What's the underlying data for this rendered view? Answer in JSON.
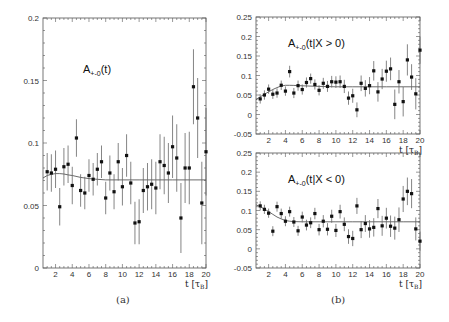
{
  "figure": {
    "captions": [
      "(a)",
      "(b)"
    ]
  },
  "chart_data": [
    {
      "type": "scatter",
      "panel": "a",
      "title": "A+-0(t)",
      "title_main": "A",
      "title_sub": "+-0",
      "title_rest": "(t)",
      "xlabel": "t [τB]",
      "ylabel": "",
      "xlim": [
        0.5,
        20
      ],
      "ylim": [
        0,
        0.2
      ],
      "xticks": [
        2,
        4,
        6,
        8,
        10,
        12,
        14,
        16,
        18,
        20
      ],
      "yticks": [
        0,
        0.05,
        0.1,
        0.15,
        0.2
      ],
      "ytick_labels": [
        "0",
        "0.05",
        "0.1",
        "0.15",
        "0.2"
      ],
      "grid": false,
      "fit_line": {
        "x": [
          0.5,
          1,
          1.5,
          2,
          2.5,
          3,
          3.5,
          4,
          5,
          6,
          7,
          8,
          10,
          12,
          14,
          16,
          18,
          20
        ],
        "y": [
          0.072,
          0.074,
          0.075,
          0.0755,
          0.0755,
          0.0752,
          0.0745,
          0.074,
          0.0725,
          0.0715,
          0.071,
          0.0705,
          0.0705,
          0.0705,
          0.0705,
          0.0705,
          0.0705,
          0.0705
        ]
      },
      "points": {
        "x": [
          1.0,
          1.5,
          2.0,
          2.5,
          3.0,
          3.5,
          4.0,
          4.5,
          5.0,
          5.5,
          6.0,
          6.5,
          7.0,
          7.5,
          8.0,
          8.5,
          9.0,
          9.5,
          10.0,
          10.5,
          11.0,
          11.5,
          12.0,
          12.5,
          13.0,
          13.5,
          14.0,
          14.5,
          15.0,
          15.5,
          16.0,
          16.5,
          17.0,
          17.5,
          18.0,
          18.5,
          19.0,
          19.5,
          20.0
        ],
        "y": [
          0.077,
          0.076,
          0.079,
          0.049,
          0.081,
          0.083,
          0.066,
          0.104,
          0.062,
          0.06,
          0.074,
          0.071,
          0.079,
          0.085,
          0.056,
          0.076,
          0.061,
          0.085,
          0.065,
          0.09,
          0.068,
          0.036,
          0.037,
          0.062,
          0.065,
          0.067,
          0.064,
          0.085,
          0.082,
          0.076,
          0.097,
          0.088,
          0.04,
          0.08,
          0.08,
          0.145,
          0.12,
          0.052,
          0.093
        ],
        "err": [
          0.015,
          0.015,
          0.015,
          0.015,
          0.015,
          0.015,
          0.015,
          0.015,
          0.013,
          0.013,
          0.013,
          0.013,
          0.013,
          0.013,
          0.013,
          0.014,
          0.014,
          0.015,
          0.015,
          0.017,
          0.017,
          0.017,
          0.018,
          0.018,
          0.019,
          0.02,
          0.021,
          0.022,
          0.023,
          0.024,
          0.025,
          0.027,
          0.028,
          0.028,
          0.029,
          0.03,
          0.032,
          0.033,
          0.035
        ]
      },
      "frame": {
        "x0": 43,
        "y0": 18,
        "x1": 206,
        "y1": 268
      }
    },
    {
      "type": "scatter",
      "panel": "b-top",
      "title": "A+-0(t|X > 0)",
      "title_main": "A",
      "title_sub": "+-0",
      "title_rest": "(t|X > 0)",
      "xlabel": "t [τB]",
      "ylabel": "",
      "xlim": [
        0.5,
        20
      ],
      "ylim": [
        -0.05,
        0.25
      ],
      "xticks": [
        2,
        4,
        6,
        8,
        10,
        12,
        14,
        16,
        18,
        20
      ],
      "yticks": [
        -0.05,
        0,
        0.05,
        0.1,
        0.15,
        0.2,
        0.25
      ],
      "ytick_labels": [
        "-0.05",
        "0",
        "0.05",
        "0.1",
        "0.15",
        "0.2",
        "0.25"
      ],
      "grid": false,
      "fit_line": {
        "x": [
          0.5,
          1,
          1.5,
          2,
          2.5,
          3,
          3.5,
          4,
          4.5,
          5,
          6,
          8,
          10,
          12,
          14,
          16,
          18,
          20
        ],
        "y": [
          0.038,
          0.045,
          0.052,
          0.058,
          0.064,
          0.069,
          0.073,
          0.075,
          0.075,
          0.0745,
          0.0735,
          0.072,
          0.071,
          0.071,
          0.071,
          0.071,
          0.071,
          0.071
        ]
      },
      "points": {
        "x": [
          1.0,
          1.5,
          2.0,
          2.5,
          3.0,
          3.5,
          4.0,
          4.5,
          5.0,
          5.5,
          6.0,
          6.5,
          7.0,
          7.5,
          8.0,
          8.5,
          9.0,
          9.5,
          10.0,
          10.5,
          11.0,
          11.5,
          12.0,
          12.5,
          13.0,
          13.5,
          14.0,
          14.5,
          15.0,
          15.5,
          16.0,
          16.5,
          17.0,
          17.5,
          18.0,
          18.5,
          19.0,
          19.5,
          20.0
        ],
        "y": [
          0.04,
          0.05,
          0.065,
          0.052,
          0.055,
          0.075,
          0.06,
          0.11,
          0.055,
          0.074,
          0.064,
          0.082,
          0.092,
          0.077,
          0.062,
          0.08,
          0.072,
          0.084,
          0.083,
          0.084,
          0.072,
          0.042,
          0.048,
          0.012,
          0.08,
          0.067,
          0.074,
          0.112,
          0.058,
          0.091,
          0.111,
          0.117,
          0.026,
          0.084,
          0.033,
          0.14,
          0.096,
          0.053,
          0.165
        ],
        "err": [
          0.012,
          0.012,
          0.012,
          0.012,
          0.012,
          0.012,
          0.012,
          0.015,
          0.013,
          0.013,
          0.013,
          0.013,
          0.013,
          0.013,
          0.013,
          0.014,
          0.014,
          0.015,
          0.015,
          0.016,
          0.017,
          0.017,
          0.018,
          0.019,
          0.02,
          0.021,
          0.022,
          0.025,
          0.025,
          0.026,
          0.027,
          0.029,
          0.038,
          0.03,
          0.038,
          0.04,
          0.033,
          0.04,
          0.035
        ]
      },
      "frame": {
        "x0": 256,
        "y0": 17,
        "x1": 420,
        "y1": 134
      }
    },
    {
      "type": "scatter",
      "panel": "b-bottom",
      "title": "A+-0(t|X < 0)",
      "title_main": "A",
      "title_sub": "+-0",
      "title_rest": "(t|X < 0)",
      "xlabel": "t [τB]",
      "ylabel": "",
      "xlim": [
        0.5,
        20
      ],
      "ylim": [
        -0.05,
        0.25
      ],
      "xticks": [
        2,
        4,
        6,
        8,
        10,
        12,
        14,
        16,
        18,
        20
      ],
      "yticks": [
        -0.05,
        0,
        0.05,
        0.1,
        0.15,
        0.2,
        0.25
      ],
      "ytick_labels": [
        "-0.05",
        "0",
        "0.05",
        "0.1",
        "0.15",
        "0.2",
        "0.25"
      ],
      "grid": false,
      "fit_line": {
        "x": [
          0.5,
          1,
          1.5,
          2,
          2.5,
          3,
          3.5,
          4,
          4.5,
          5,
          6,
          8,
          10,
          12,
          14,
          16,
          18,
          20
        ],
        "y": [
          0.115,
          0.11,
          0.104,
          0.097,
          0.09,
          0.083,
          0.078,
          0.074,
          0.072,
          0.071,
          0.0705,
          0.0705,
          0.0705,
          0.0705,
          0.0705,
          0.0705,
          0.0705,
          0.0705
        ]
      },
      "points": {
        "x": [
          1.0,
          1.5,
          2.0,
          2.5,
          3.0,
          3.5,
          4.0,
          4.5,
          5.0,
          5.5,
          6.0,
          6.5,
          7.0,
          7.5,
          8.0,
          8.5,
          9.0,
          9.5,
          10.0,
          10.5,
          11.0,
          11.5,
          12.0,
          12.5,
          13.0,
          13.5,
          14.0,
          14.5,
          15.0,
          15.5,
          16.0,
          16.5,
          17.0,
          17.5,
          18.0,
          18.5,
          19.0,
          19.5,
          20.0
        ],
        "y": [
          0.112,
          0.103,
          0.093,
          0.046,
          0.11,
          0.092,
          0.072,
          0.097,
          0.07,
          0.047,
          0.083,
          0.062,
          0.068,
          0.092,
          0.05,
          0.072,
          0.051,
          0.085,
          0.048,
          0.097,
          0.064,
          0.032,
          0.027,
          0.112,
          0.05,
          0.066,
          0.052,
          0.056,
          0.105,
          0.06,
          0.08,
          0.059,
          0.054,
          0.076,
          0.13,
          0.15,
          0.144,
          0.052,
          0.02
        ],
        "err": [
          0.012,
          0.012,
          0.012,
          0.013,
          0.013,
          0.013,
          0.013,
          0.013,
          0.013,
          0.013,
          0.014,
          0.014,
          0.014,
          0.015,
          0.015,
          0.016,
          0.016,
          0.017,
          0.017,
          0.018,
          0.018,
          0.019,
          0.02,
          0.021,
          0.022,
          0.022,
          0.023,
          0.024,
          0.025,
          0.026,
          0.027,
          0.028,
          0.03,
          0.032,
          0.034,
          0.036,
          0.038,
          0.03,
          0.025
        ]
      },
      "frame": {
        "x0": 256,
        "y0": 153,
        "x1": 420,
        "y1": 268
      }
    }
  ]
}
